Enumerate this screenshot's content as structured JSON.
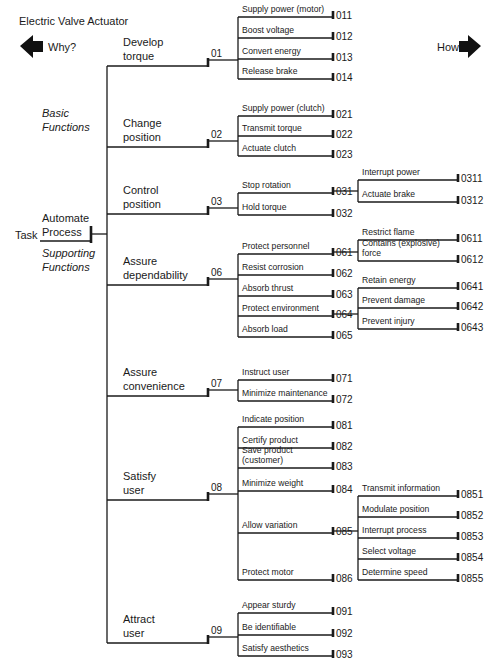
{
  "title": "Electric Valve Actuator",
  "nav": {
    "why_label": "Why?",
    "how_label": "How?",
    "why_icon": "left-arrow-icon",
    "how_icon": "right-arrow-icon"
  },
  "task": {
    "label": "Task",
    "name": [
      "Automate",
      "Process"
    ]
  },
  "categories": [
    {
      "lines": [
        "Basic",
        "Functions"
      ],
      "x": 42,
      "y": 117
    },
    {
      "lines": [
        "Supporting",
        "Functions"
      ],
      "x": 42,
      "y": 257
    }
  ],
  "functions": [
    {
      "code": "01",
      "lines": [
        "Develop",
        "torque"
      ],
      "y": 66,
      "sub_x1": 238,
      "sub_x2": 333,
      "subs": [
        {
          "code": "011",
          "lines": [
            "Supply power (motor)"
          ],
          "y": 17
        },
        {
          "code": "012",
          "lines": [
            "Boost voltage"
          ],
          "y": 38
        },
        {
          "code": "013",
          "lines": [
            "Convert energy"
          ],
          "y": 59
        },
        {
          "code": "014",
          "lines": [
            "Release brake"
          ],
          "y": 79
        }
      ]
    },
    {
      "code": "02",
      "lines": [
        "Change",
        "position"
      ],
      "y": 147,
      "sub_x1": 238,
      "sub_x2": 333,
      "subs": [
        {
          "code": "021",
          "lines": [
            "Supply power (clutch)"
          ],
          "y": 116
        },
        {
          "code": "022",
          "lines": [
            "Transmit torque"
          ],
          "y": 136
        },
        {
          "code": "023",
          "lines": [
            "Actuate clutch"
          ],
          "y": 156
        }
      ]
    },
    {
      "code": "03",
      "lines": [
        "Control",
        "position"
      ],
      "y": 214,
      "sub_x1": 238,
      "sub_x2": 333,
      "subs": [
        {
          "code": "031",
          "lines": [
            "Stop rotation"
          ],
          "y": 193,
          "sub_x1": 358,
          "sub_x2": 458,
          "subs": [
            {
              "code": "0311",
              "lines": [
                "Interrupt power"
              ],
              "y": 180
            },
            {
              "code": "0312",
              "lines": [
                "Actuate brake"
              ],
              "y": 202
            }
          ]
        },
        {
          "code": "032",
          "lines": [
            "Hold torque"
          ],
          "y": 215
        }
      ]
    },
    {
      "code": "06",
      "lines": [
        "Assure",
        "dependability"
      ],
      "y": 285,
      "sub_x1": 238,
      "sub_x2": 333,
      "subs": [
        {
          "code": "061",
          "lines": [
            "Protect personnel"
          ],
          "y": 254,
          "sub_x1": 358,
          "sub_x2": 458,
          "subs": [
            {
              "code": "0611",
              "lines": [
                "Restrict flame"
              ],
              "y": 240
            },
            {
              "code": "0612",
              "lines": [
                "Contains (explosive)",
                "force"
              ],
              "y": 261
            }
          ]
        },
        {
          "code": "062",
          "lines": [
            "Resist corrosion"
          ],
          "y": 275
        },
        {
          "code": "063",
          "lines": [
            "Absorb thrust"
          ],
          "y": 296
        },
        {
          "code": "064",
          "lines": [
            "Protect environment"
          ],
          "y": 316,
          "sub_x1": 358,
          "sub_x2": 458,
          "subs": [
            {
              "code": "0641",
              "lines": [
                "Retain energy"
              ],
              "y": 288
            },
            {
              "code": "0642",
              "lines": [
                "Prevent damage"
              ],
              "y": 308
            },
            {
              "code": "0643",
              "lines": [
                "Prevent injury"
              ],
              "y": 329
            }
          ]
        },
        {
          "code": "065",
          "lines": [
            "Absorb load"
          ],
          "y": 337
        }
      ]
    },
    {
      "code": "07",
      "lines": [
        "Assure",
        "convenience"
      ],
      "y": 396,
      "sub_x1": 238,
      "sub_x2": 333,
      "subs": [
        {
          "code": "071",
          "lines": [
            "Instruct user"
          ],
          "y": 380
        },
        {
          "code": "072",
          "lines": [
            "Minimize maintenance"
          ],
          "y": 401
        }
      ]
    },
    {
      "code": "08",
      "lines": [
        "Satisfy",
        "user"
      ],
      "y": 500,
      "sub_x1": 238,
      "sub_x2": 333,
      "subs": [
        {
          "code": "081",
          "lines": [
            "Indicate position"
          ],
          "y": 427
        },
        {
          "code": "082",
          "lines": [
            "Certify product"
          ],
          "y": 448
        },
        {
          "code": "083",
          "lines": [
            "Save product",
            "(customer)"
          ],
          "y": 468
        },
        {
          "code": "084",
          "lines": [
            "Minimize weight"
          ],
          "y": 491
        },
        {
          "code": "085",
          "lines": [
            "Allow variation"
          ],
          "y": 533,
          "sub_x1": 358,
          "sub_x2": 458,
          "subs": [
            {
              "code": "0851",
              "lines": [
                "Transmit information"
              ],
              "y": 496
            },
            {
              "code": "0852",
              "lines": [
                "Modulate position"
              ],
              "y": 517
            },
            {
              "code": "0853",
              "lines": [
                "Interrupt process"
              ],
              "y": 538
            },
            {
              "code": "0854",
              "lines": [
                "Select voltage"
              ],
              "y": 559
            },
            {
              "code": "0855",
              "lines": [
                "Determine speed"
              ],
              "y": 580
            }
          ]
        },
        {
          "code": "086",
          "lines": [
            "Protect motor"
          ],
          "y": 580
        }
      ]
    },
    {
      "code": "09",
      "lines": [
        "Attract",
        "user"
      ],
      "y": 643,
      "sub_x1": 238,
      "sub_x2": 333,
      "subs": [
        {
          "code": "091",
          "lines": [
            "Appear sturdy"
          ],
          "y": 613
        },
        {
          "code": "092",
          "lines": [
            "Be identifiable"
          ],
          "y": 635
        },
        {
          "code": "093",
          "lines": [
            "Satisfy aesthetics"
          ],
          "y": 656
        }
      ]
    }
  ]
}
